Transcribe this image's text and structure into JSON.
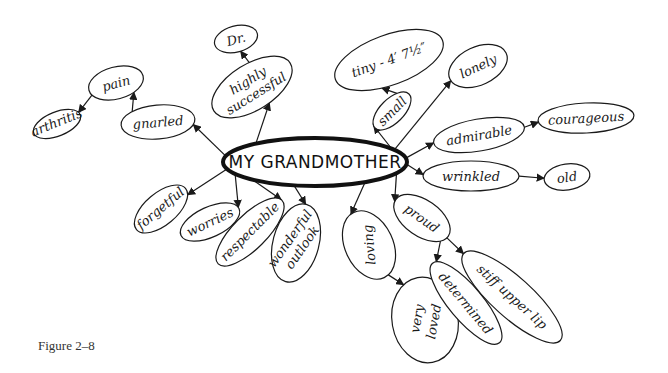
{
  "figure": {
    "caption": "Figure 2–8",
    "title": "MY GRANDMOTHER",
    "stroke_color": "#1a1a1a",
    "background_color": "#ffffff"
  },
  "center": {
    "label": "MY GRANDMOTHER",
    "cx": 315,
    "cy": 162,
    "rx": 92,
    "ry": 24
  },
  "nodes": [
    {
      "id": "gnarled",
      "label": "gnarled",
      "cx": 158,
      "cy": 122,
      "rx": 37,
      "ry": 17,
      "rot": -5,
      "parent": "center"
    },
    {
      "id": "pain",
      "label": "pain",
      "cx": 116,
      "cy": 83,
      "rx": 28,
      "ry": 16,
      "rot": -15,
      "parent": "gnarled"
    },
    {
      "id": "arthritis",
      "label": "arthritis",
      "cx": 57,
      "cy": 124,
      "rx": 25,
      "ry": 12,
      "rot": -22,
      "parent": "pain"
    },
    {
      "id": "highly-successful",
      "label": "highly successful",
      "cx": 252,
      "cy": 87,
      "rx": 45,
      "ry": 23,
      "rot": -32,
      "parent": "center"
    },
    {
      "id": "dr",
      "label": "Dr.",
      "cx": 236,
      "cy": 39,
      "rx": 22,
      "ry": 13,
      "rot": -15,
      "parent": "highly-successful"
    },
    {
      "id": "small",
      "label": "small",
      "cx": 392,
      "cy": 111,
      "rx": 24,
      "ry": 12,
      "rot": -45,
      "parent": "center"
    },
    {
      "id": "tiny",
      "label": "tiny - 4′ 7½″",
      "cx": 389,
      "cy": 60,
      "rx": 57,
      "ry": 25,
      "rot": -20,
      "parent": "small"
    },
    {
      "id": "lonely",
      "label": "lonely",
      "cx": 478,
      "cy": 66,
      "rx": 31,
      "ry": 19,
      "rot": -25,
      "parent": "center"
    },
    {
      "id": "admirable",
      "label": "admirable",
      "cx": 479,
      "cy": 135,
      "rx": 46,
      "ry": 16,
      "rot": -10,
      "parent": "center"
    },
    {
      "id": "courageous",
      "label": "courageous",
      "cx": 586,
      "cy": 118,
      "rx": 48,
      "ry": 15,
      "rot": -3,
      "parent": "admirable"
    },
    {
      "id": "wrinkled",
      "label": "wrinkled",
      "cx": 471,
      "cy": 176,
      "rx": 48,
      "ry": 15,
      "rot": 0,
      "parent": "center"
    },
    {
      "id": "old",
      "label": "old",
      "cx": 567,
      "cy": 177,
      "rx": 23,
      "ry": 13,
      "rot": -8,
      "parent": "wrinkled"
    },
    {
      "id": "forgetful",
      "label": "forgetful",
      "cx": 161,
      "cy": 209,
      "rx": 32,
      "ry": 16,
      "rot": -40,
      "parent": "center"
    },
    {
      "id": "worries",
      "label": "worries",
      "cx": 210,
      "cy": 222,
      "rx": 32,
      "ry": 15,
      "rot": -25,
      "parent": "center"
    },
    {
      "id": "respectable",
      "label": "respectable",
      "cx": 250,
      "cy": 232,
      "rx": 45,
      "ry": 17,
      "rot": -45,
      "parent": "center"
    },
    {
      "id": "wonderful-outlook",
      "label": "wonderful outlook",
      "cx": 296,
      "cy": 243,
      "rx": 23,
      "ry": 40,
      "rot": 15,
      "parent": "center"
    },
    {
      "id": "loving",
      "label": "loving",
      "cx": 369,
      "cy": 245,
      "rx": 24,
      "ry": 36,
      "rot": -25,
      "parent": "center"
    },
    {
      "id": "very-loved",
      "label": "very loved",
      "cx": 425,
      "cy": 320,
      "rx": 33,
      "ry": 43,
      "rot": -10,
      "parent": "loving"
    },
    {
      "id": "proud",
      "label": "proud",
      "cx": 422,
      "cy": 218,
      "rx": 32,
      "ry": 18,
      "rot": 35,
      "parent": "center"
    },
    {
      "id": "determined",
      "label": "determined",
      "cx": 466,
      "cy": 303,
      "rx": 52,
      "ry": 17,
      "rot": 50,
      "parent": "proud"
    },
    {
      "id": "stiff-upper-lip",
      "label": "stiff upper lip",
      "cx": 512,
      "cy": 297,
      "rx": 65,
      "ry": 20,
      "rot": 42,
      "parent": "proud"
    }
  ]
}
